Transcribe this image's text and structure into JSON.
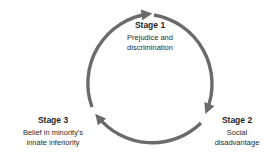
{
  "diagram": {
    "type": "cycle",
    "arrow_color": "#6b6b6b",
    "stages": [
      {
        "title": "Stage 1",
        "description_lines": [
          "Prejudice and",
          "discrimination"
        ]
      },
      {
        "title": "Stage 2",
        "description_lines": [
          "Social",
          "disadvantage"
        ]
      },
      {
        "title": "Stage 3",
        "description_lines": [
          "Belief in minority's",
          "innate inferiority"
        ]
      }
    ],
    "flow": [
      "Stage 1",
      "Stage 2",
      "Stage 3",
      "Stage 1"
    ]
  }
}
